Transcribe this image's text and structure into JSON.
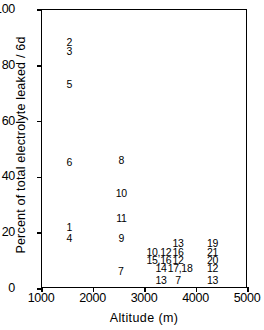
{
  "chart_data": {
    "type": "scatter",
    "title": "",
    "xlabel": "Altitude (m)",
    "ylabel": "Percent of total electrolyte leaked / 6d",
    "xlim": [
      1000,
      5000
    ],
    "ylim": [
      0,
      100
    ],
    "xticks": [
      "1000",
      "2000",
      "3000",
      "4000",
      "5000"
    ],
    "yticks": [
      "0",
      "20",
      "40",
      "60",
      "80",
      "100"
    ],
    "grid": false,
    "legend": "none",
    "marker_style": "numeric-text-labels",
    "note": "Each plotted marker is the sample number drawn as text at its (altitude, leakage) position.",
    "points": [
      {
        "label": "2",
        "x": 1550,
        "y": 88
      },
      {
        "label": "3",
        "x": 1550,
        "y": 85
      },
      {
        "label": "5",
        "x": 1550,
        "y": 73
      },
      {
        "label": "6",
        "x": 1550,
        "y": 45
      },
      {
        "label": "1",
        "x": 1550,
        "y": 22
      },
      {
        "label": "4",
        "x": 1550,
        "y": 18
      },
      {
        "label": "8",
        "x": 2560,
        "y": 46
      },
      {
        "label": "10",
        "x": 2560,
        "y": 34
      },
      {
        "label": "11",
        "x": 2560,
        "y": 25
      },
      {
        "label": "9",
        "x": 2560,
        "y": 18
      },
      {
        "label": "7",
        "x": 2550,
        "y": 6
      },
      {
        "label": "13",
        "x": 3660,
        "y": 16
      },
      {
        "label": "10,12",
        "x": 3290,
        "y": 13
      },
      {
        "label": "16",
        "x": 3660,
        "y": 13
      },
      {
        "label": "15,16",
        "x": 3290,
        "y": 10
      },
      {
        "label": "12",
        "x": 3660,
        "y": 10
      },
      {
        "label": "14",
        "x": 3330,
        "y": 7
      },
      {
        "label": "17,18",
        "x": 3700,
        "y": 7
      },
      {
        "label": "13",
        "x": 3330,
        "y": 3
      },
      {
        "label": "7",
        "x": 3660,
        "y": 3
      },
      {
        "label": "19",
        "x": 4330,
        "y": 16
      },
      {
        "label": "21",
        "x": 4330,
        "y": 13
      },
      {
        "label": "20",
        "x": 4330,
        "y": 10
      },
      {
        "label": "12",
        "x": 4330,
        "y": 7
      },
      {
        "label": "13",
        "x": 4330,
        "y": 3
      }
    ]
  }
}
